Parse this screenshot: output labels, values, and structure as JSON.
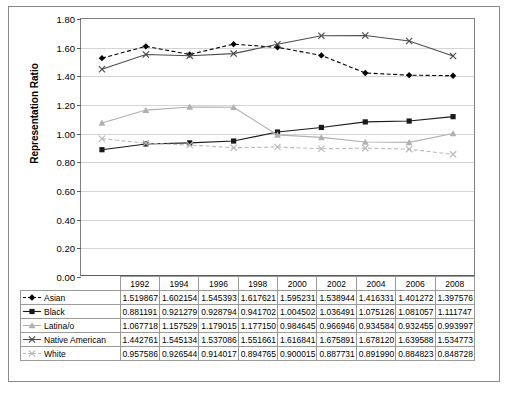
{
  "chart_data": {
    "type": "line",
    "title": "",
    "xlabel": "",
    "ylabel": "Representation Ratio",
    "categories": [
      "1992",
      "1994",
      "1996",
      "1998",
      "2000",
      "2002",
      "2004",
      "2006",
      "2008"
    ],
    "ylim": [
      0.0,
      1.8
    ],
    "ytick_labels": [
      "0.00",
      "0.20",
      "0.40",
      "0.60",
      "0.80",
      "1.00",
      "1.20",
      "1.40",
      "1.60",
      "1.80"
    ],
    "ytick_values": [
      0.0,
      0.2,
      0.4,
      0.6,
      0.8,
      1.0,
      1.2,
      1.4,
      1.6,
      1.8
    ],
    "grid": true,
    "legend_position": "table-row-labels",
    "series": [
      {
        "name": "Asian",
        "marker": "diamond",
        "line_style": "dashed",
        "color": "#000000",
        "values": [
          1.519867,
          1.602154,
          1.545393,
          1.617621,
          1.595231,
          1.538944,
          1.416331,
          1.401272,
          1.397576
        ],
        "labels": [
          "1.519867",
          "1.602154",
          "1.545393",
          "1.617621",
          "1.595231",
          "1.538944",
          "1.416331",
          "1.401272",
          "1.397576"
        ]
      },
      {
        "name": "Black",
        "marker": "square",
        "line_style": "solid",
        "color": "#1a1a1a",
        "values": [
          0.881191,
          0.921279,
          0.928794,
          0.941702,
          1.004502,
          1.036491,
          1.075126,
          1.081057,
          1.111747
        ],
        "labels": [
          "0.881191",
          "0.921279",
          "0.928794",
          "0.941702",
          "1.004502",
          "1.036491",
          "1.075126",
          "1.081057",
          "1.111747"
        ]
      },
      {
        "name": "Latina/o",
        "marker": "triangle",
        "line_style": "solid",
        "color": "#b0b0b0",
        "values": [
          1.067718,
          1.157529,
          1.179015,
          1.17715,
          0.984645,
          0.966946,
          0.934584,
          0.932455,
          0.993997
        ],
        "labels": [
          "1.067718",
          "1.157529",
          "1.179015",
          "1.177150",
          "0.984645",
          "0.966946",
          "0.934584",
          "0.932455",
          "0.993997"
        ]
      },
      {
        "name": "Native American",
        "marker": "cross",
        "line_style": "solid",
        "color": "#4d4d4d",
        "values": [
          1.442761,
          1.545134,
          1.537086,
          1.551661,
          1.616841,
          1.675891,
          1.67812,
          1.639588,
          1.534773
        ],
        "labels": [
          "1.442761",
          "1.545134",
          "1.537086",
          "1.551661",
          "1.616841",
          "1.675891",
          "1.678120",
          "1.639588",
          "1.534773"
        ]
      },
      {
        "name": "White",
        "marker": "cross",
        "line_style": "dashed",
        "color": "#b8b8b8",
        "values": [
          0.957586,
          0.926544,
          0.914017,
          0.894765,
          0.900015,
          0.887731,
          0.89199,
          0.884823,
          0.848728
        ],
        "labels": [
          "0.957586",
          "0.926544",
          "0.914017",
          "0.894765",
          "0.900015",
          "0.887731",
          "0.891990",
          "0.884823",
          "0.848728"
        ]
      }
    ]
  }
}
